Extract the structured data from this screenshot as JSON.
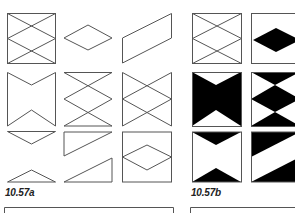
{
  "figure": {
    "panels": [
      {
        "id": "a",
        "caption": "10.57a",
        "style": "outline",
        "stroke": "#555555",
        "cells": [
          "square with double X (two crossing zigzags)",
          "rhombus",
          "parallelogram",
          "notched banner (bow-tie outline)",
          "double X hourglass (square without sides)",
          "double X hourglass with vertical sides",
          "downward triangle",
          "right triangle (upper)",
          "square containing rhombus",
          "upward triangle",
          "right triangle (lower)"
        ]
      },
      {
        "id": "b",
        "caption": "10.57b",
        "style": "filled",
        "fill": "#000000",
        "cells": [
          "square with double X (outline)",
          "square with black rhombus",
          "black bow-tie with white notches",
          "black stacked triangles (diamond pattern)",
          "white square with black top and bottom notches",
          "square split diagonally black/white"
        ]
      }
    ]
  },
  "colors": {
    "background": "#ffffff",
    "line": "#555555",
    "fill": "#000000",
    "text": "#222222"
  }
}
